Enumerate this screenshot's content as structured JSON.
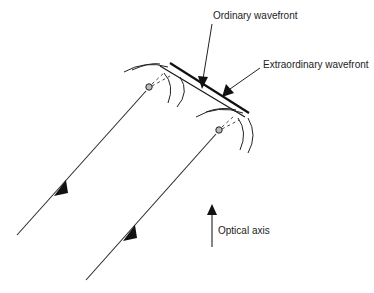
{
  "diagram": {
    "labels": {
      "ordinary_wavefront": "Ordinary wavefront",
      "extraordinary_wavefront": "Extraordinary wavefront",
      "optical_axis": "Optical axis"
    },
    "colors": {
      "line": "#2a2a2a",
      "background": "#ffffff"
    },
    "rays": [
      {
        "name": "incident-ray-1",
        "from": [
          17,
          235
        ],
        "to": [
          149,
          87
        ],
        "arrow_at": [
          61,
          187
        ]
      },
      {
        "name": "incident-ray-2",
        "from": [
          86,
          280
        ],
        "to": [
          219,
          130
        ],
        "arrow_at": [
          130,
          232
        ]
      }
    ],
    "sources": [
      {
        "name": "secondary-source-1",
        "center": [
          149,
          87
        ]
      },
      {
        "name": "secondary-source-2",
        "center": [
          219,
          130
        ]
      }
    ]
  }
}
